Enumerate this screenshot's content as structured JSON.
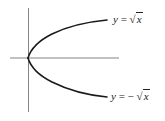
{
  "figure": {
    "title": "",
    "colors": {
      "curve": "#1a1a1a",
      "axis": "#555555",
      "text": "#222222",
      "background": "#ffffff"
    },
    "axes": {
      "origin_px": [
        28,
        58
      ],
      "x_axis_px": {
        "from": 10,
        "to": 119
      },
      "y_axis_px": {
        "from": 8,
        "to": 112
      }
    },
    "curves": [
      {
        "name": "upper",
        "equation": "y = √x",
        "label": {
          "lhs": "y",
          "eq": " = ",
          "neg": "",
          "rad": "√",
          "arg": "x"
        }
      },
      {
        "name": "lower",
        "equation": "y = −√x",
        "label": {
          "lhs": "y",
          "eq": " = ",
          "neg": "− ",
          "rad": "√",
          "arg": "x"
        }
      }
    ]
  }
}
